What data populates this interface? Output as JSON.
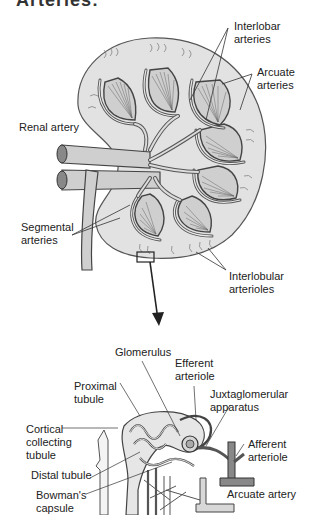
{
  "title_cut": "Arteries:",
  "kidney": {
    "labels": {
      "interlobar": "Interlobar\narteries",
      "arcuate": "Arcuate\narteries",
      "renal": "Renal artery",
      "segmental": "Segmental\narteries",
      "interlobular": "Interlobular\narterioles"
    }
  },
  "nephron": {
    "labels": {
      "glomerulus": "Glomerulus",
      "efferent": "Efferent\narteriole",
      "proximal": "Proximal\ntubule",
      "juxta": "Juxtaglomerular\napparatus",
      "cortical": "Cortical\ncollecting\ntubule",
      "afferent": "Afferent\narteriole",
      "distal": "Distal tubule",
      "bowman": "Bowman's\ncapsule",
      "arcuate_artery": "Arcuate artery"
    }
  },
  "colors": {
    "kidney_fill": "#e2e2e2",
    "vessel_fill": "#bdbdbd",
    "outline": "#444444",
    "text": "#222222"
  }
}
